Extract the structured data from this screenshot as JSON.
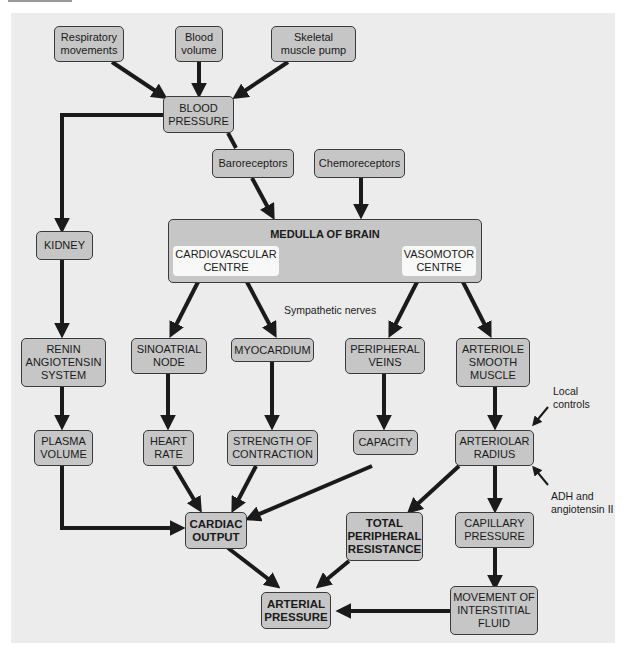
{
  "diagram": {
    "nodes": {
      "respiratory": "Respiratory\nmovements",
      "blood_volume": "Blood\nvolume",
      "skeletal": "Skeletal\nmuscle pump",
      "blood_pressure": "BLOOD\nPRESSURE",
      "baroreceptors": "Baroreceptors",
      "chemoreceptors": "Chemoreceptors",
      "kidney": "KIDNEY",
      "medulla": "MEDULLA OF BRAIN",
      "cardio_centre": "CARDIOVASCULAR\nCENTRE",
      "vasomotor_centre": "VASOMOTOR\nCENTRE",
      "renin": "RENIN\nANGIOTENSIN\nSYSTEM",
      "sinoatrial": "SINOATRIAL\nNODE",
      "myocardium": "MYOCARDIUM",
      "peripheral_veins": "PERIPHERAL\nVEINS",
      "arteriole_muscle": "ARTERIOLE\nSMOOTH\nMUSCLE",
      "plasma_volume": "PLASMA\nVOLUME",
      "heart_rate": "HEART\nRATE",
      "strength": "STRENGTH OF\nCONTRACTION",
      "capacity": "CAPACITY",
      "arteriolar_radius": "ARTERIOLAR\nRADIUS",
      "cardiac_output": "CARDIAC\nOUTPUT",
      "tpr": "TOTAL\nPERIPHERAL\nRESISTANCE",
      "capillary_pressure": "CAPILLARY\nPRESSURE",
      "arterial_pressure": "ARTERIAL\nPRESSURE",
      "interstitial": "MOVEMENT OF\nINTERSTITIAL\nFLUID"
    },
    "labels": {
      "sympathetic": "Sympathetic nerves",
      "local_controls": "Local\ncontrols",
      "adh": "ADH and\nangiotensin II"
    },
    "colors": {
      "panel": "#ececec",
      "box_fill": "#c6c6c6",
      "sub_box_fill": "#f8f8f8",
      "arrow": "#1a1a1a"
    }
  }
}
